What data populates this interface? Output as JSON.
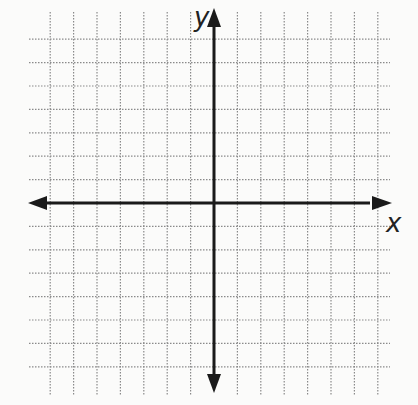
{
  "diagram": {
    "type": "coordinate-plane",
    "axis_labels": {
      "x": "x",
      "y": "y"
    },
    "grid": {
      "style": "dotted",
      "line_color": "#8a8a8a",
      "axis_color": "#1a1a1a",
      "background": "#fbfbfa",
      "columns_left_of_y_axis": 8,
      "columns_right_of_y_axis": 7,
      "rows_above_x_axis": 8,
      "rows_below_x_axis": 7,
      "spacing_px": 23.4,
      "origin_px": [
        214,
        203
      ]
    }
  }
}
